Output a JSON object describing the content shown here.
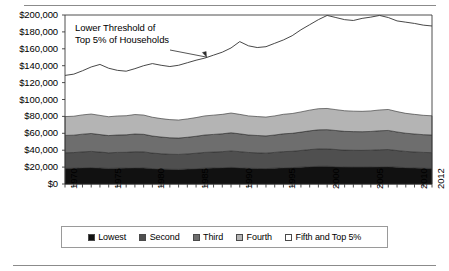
{
  "chart_data": {
    "type": "area",
    "title": "",
    "subtitle": "",
    "xlabel": "",
    "ylabel": "",
    "stacked": true,
    "grid": false,
    "legend_position": "bottom",
    "xlim": [
      1970,
      2012
    ],
    "ylim": [
      0,
      200000
    ],
    "ytick_labels": [
      "$200,000",
      "$180,000",
      "$160,000",
      "$140,000",
      "$120,000",
      "$100,000",
      "$80,000",
      "$60,000",
      "$40,000",
      "$20,000",
      "$0"
    ],
    "ytick_values": [
      200000,
      180000,
      160000,
      140000,
      120000,
      100000,
      80000,
      60000,
      40000,
      20000,
      0
    ],
    "xtick_labels": [
      "1970",
      "1975",
      "1980",
      "1985",
      "1990",
      "1995",
      "2000",
      "2005",
      "2010",
      "2012"
    ],
    "xtick_values": [
      1970,
      1975,
      1980,
      1985,
      1990,
      1995,
      2000,
      2005,
      2010,
      2012
    ],
    "x": [
      1970,
      1971,
      1972,
      1973,
      1974,
      1975,
      1976,
      1977,
      1978,
      1979,
      1980,
      1981,
      1982,
      1983,
      1984,
      1985,
      1986,
      1987,
      1988,
      1989,
      1990,
      1991,
      1992,
      1993,
      1994,
      1995,
      1996,
      1997,
      1998,
      1999,
      2000,
      2001,
      2002,
      2003,
      2004,
      2005,
      2006,
      2007,
      2008,
      2009,
      2010,
      2011,
      2012
    ],
    "series": [
      {
        "name": "Lowest",
        "color": "#111111",
        "values": [
          18500,
          18600,
          19200,
          19400,
          18900,
          18400,
          18700,
          18800,
          19200,
          19000,
          18200,
          17800,
          17400,
          17300,
          17700,
          18100,
          18700,
          19000,
          19300,
          19700,
          19200,
          18600,
          18400,
          18200,
          18700,
          19200,
          19400,
          19900,
          20500,
          20900,
          21000,
          20500,
          20100,
          20000,
          20000,
          20100,
          20400,
          20500,
          19900,
          19300,
          19000,
          18600,
          18400
        ]
      },
      {
        "name": "Second",
        "color": "#4f4f4f",
        "values": [
          37000,
          37200,
          38000,
          38600,
          37800,
          36900,
          37400,
          37500,
          38200,
          38000,
          36600,
          35800,
          35200,
          35000,
          35600,
          36400,
          37400,
          37800,
          38300,
          39100,
          38300,
          37300,
          36900,
          36500,
          37400,
          38300,
          38700,
          39700,
          40700,
          41500,
          41600,
          40800,
          40100,
          39900,
          39800,
          40000,
          40500,
          40800,
          39600,
          38600,
          37900,
          37400,
          37100
        ]
      },
      {
        "name": "Third",
        "color": "#6e6e6e",
        "values": [
          57500,
          57800,
          59000,
          59800,
          58500,
          57300,
          58000,
          58200,
          59200,
          58800,
          56800,
          55600,
          54700,
          54400,
          55300,
          56500,
          58000,
          58700,
          59400,
          60600,
          59400,
          58000,
          57400,
          56900,
          58000,
          59400,
          60000,
          61400,
          62900,
          64100,
          64300,
          63300,
          62300,
          62000,
          61900,
          62200,
          63000,
          63400,
          61600,
          60100,
          59200,
          58400,
          58000
        ]
      },
      {
        "name": "Fourth",
        "color": "#b4b4b4",
        "values": [
          79800,
          80200,
          81800,
          82800,
          81200,
          79600,
          80500,
          80800,
          82200,
          81600,
          79000,
          77400,
          76200,
          75700,
          77000,
          78600,
          80600,
          81500,
          82400,
          84000,
          82400,
          80600,
          79800,
          79200,
          80600,
          82500,
          83400,
          85300,
          87400,
          89100,
          89400,
          88000,
          86700,
          86200,
          86000,
          86500,
          87600,
          88200,
          85700,
          83600,
          82400,
          81300,
          80700
        ]
      },
      {
        "name": "Fifth and Top 5%",
        "color": "#ffffff",
        "values": [
          200000,
          200000,
          200000,
          200000,
          200000,
          200000,
          200000,
          200000,
          200000,
          200000,
          200000,
          200000,
          200000,
          200000,
          200000,
          200000,
          200000,
          200000,
          200000,
          200000,
          200000,
          200000,
          200000,
          200000,
          200000,
          200000,
          200000,
          200000,
          200000,
          200000,
          200000,
          200000,
          200000,
          200000,
          200000,
          200000,
          200000,
          200000,
          200000,
          200000,
          200000,
          200000,
          200000
        ]
      }
    ],
    "threshold_line": {
      "name": "Lower Threshold of Top 5% of Households",
      "color": "#333333",
      "values": [
        128500,
        130000,
        134000,
        138500,
        141500,
        137000,
        134500,
        133500,
        136500,
        140000,
        142500,
        140500,
        139000,
        140500,
        143500,
        146500,
        149000,
        152500,
        156000,
        161000,
        168500,
        163500,
        161500,
        162500,
        166500,
        170500,
        175500,
        182500,
        188500,
        194500,
        199500,
        197000,
        194500,
        193500,
        196000,
        197500,
        199500,
        197000,
        193000,
        191500,
        190000,
        188000,
        187000
      ]
    },
    "annotation": {
      "line1": "Lower Threshold of",
      "line2": "Top 5% of Households"
    },
    "legend": [
      {
        "label": "Lowest",
        "color": "#111111"
      },
      {
        "label": "Second",
        "color": "#4f4f4f"
      },
      {
        "label": "Third",
        "color": "#6e6e6e"
      },
      {
        "label": "Fourth",
        "color": "#b4b4b4"
      },
      {
        "label": "Fifth and Top 5%",
        "color": "#ffffff"
      }
    ]
  }
}
